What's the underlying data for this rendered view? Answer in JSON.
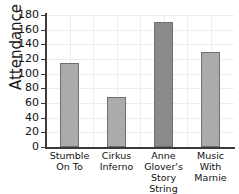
{
  "chart_data": {
    "type": "bar",
    "title": "",
    "xlabel": "",
    "ylabel": "Attendance",
    "ylim": [
      0,
      180
    ],
    "ytick_values": [
      0,
      20,
      40,
      60,
      80,
      100,
      120,
      140,
      160,
      180
    ],
    "ytick_labels": [
      "0",
      "20",
      "40",
      "60",
      "80",
      "100",
      "120",
      "140",
      "160",
      "180"
    ],
    "grid": true,
    "legend": null,
    "categories": [
      "Stumble On To",
      "Cirkus Inferno",
      "Anne Glover's Story String World",
      "Music With Marnie"
    ],
    "category_lines": [
      [
        "Stumble",
        "On To"
      ],
      [
        "Cirkus",
        "Inferno"
      ],
      [
        "Anne Glover's",
        "Story String",
        "World"
      ],
      [
        "Music",
        "With",
        "Marnie"
      ]
    ],
    "values": [
      115,
      68,
      171,
      130
    ],
    "bar_colors": [
      "#ababab",
      "#ababab",
      "#8a8a8a",
      "#ababab"
    ],
    "bar_edge_color": "#6f6f6f"
  },
  "colors": {
    "background": "#ffffff",
    "axis": "#3a3a3a",
    "gridline": "#ededed",
    "text": "#111111"
  }
}
